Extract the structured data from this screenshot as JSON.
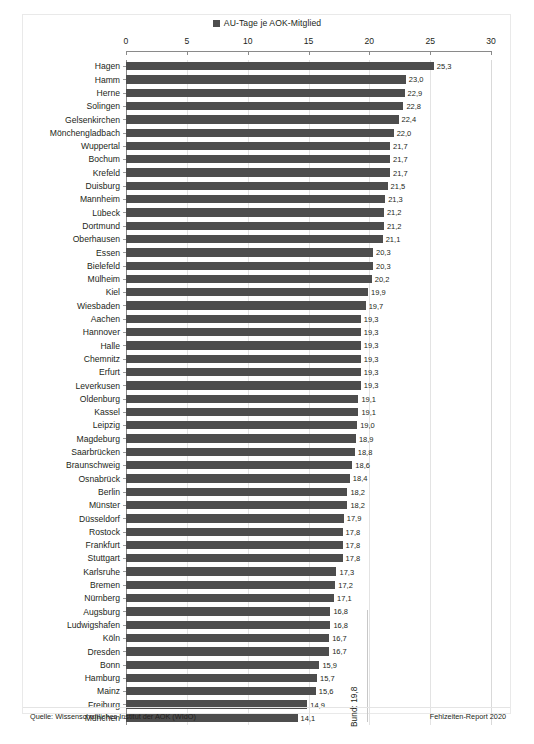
{
  "legend": {
    "swatch_color": "#4d4d4d",
    "label": "AU-Tage je AOK-Mitglied"
  },
  "footer": {
    "source": "Quelle: Wissenschaftliches Institut der AOK (WIdO)",
    "report": "Fehlzeiten-Report 2020"
  },
  "annotation": {
    "bund_label": "Bund: 19,8",
    "bund_value": 19.8
  },
  "chart_data": {
    "type": "bar",
    "orientation": "horizontal",
    "title": "",
    "subtitle": "",
    "xlabel": "",
    "ylabel": "",
    "series_name": "AU-Tage je AOK-Mitglied",
    "bar_color": "#4d4d4d",
    "grid": true,
    "legend_position": "top-center",
    "xlim": [
      0,
      30
    ],
    "xticks": [
      0,
      5,
      10,
      15,
      20,
      25,
      30
    ],
    "xtick_labels": [
      "0",
      "5",
      "10",
      "15",
      "20",
      "25",
      "30"
    ],
    "value_decimal_separator": ",",
    "reference_line": {
      "label": "Bund: 19,8",
      "value": 19.8
    },
    "categories": [
      "Hagen",
      "Hamm",
      "Herne",
      "Solingen",
      "Gelsenkirchen",
      "Mönchengladbach",
      "Wuppertal",
      "Bochum",
      "Krefeld",
      "Duisburg",
      "Mannheim",
      "Lübeck",
      "Dortmund",
      "Oberhausen",
      "Essen",
      "Bielefeld",
      "Mülheim",
      "Kiel",
      "Wiesbaden",
      "Aachen",
      "Hannover",
      "Halle",
      "Chemnitz",
      "Erfurt",
      "Leverkusen",
      "Oldenburg",
      "Kassel",
      "Leipzig",
      "Magdeburg",
      "Saarbrücken",
      "Braunschweig",
      "Osnabrück",
      "Berlin",
      "Münster",
      "Düsseldorf",
      "Rostock",
      "Frankfurt",
      "Stuttgart",
      "Karlsruhe",
      "Bremen",
      "Nürnberg",
      "Augsburg",
      "Ludwigshafen",
      "Köln",
      "Dresden",
      "Bonn",
      "Hamburg",
      "Mainz",
      "Freiburg",
      "München"
    ],
    "values": [
      25.3,
      23.0,
      22.9,
      22.8,
      22.4,
      22.0,
      21.7,
      21.7,
      21.7,
      21.5,
      21.3,
      21.2,
      21.2,
      21.1,
      20.3,
      20.3,
      20.2,
      19.9,
      19.7,
      19.3,
      19.3,
      19.3,
      19.3,
      19.3,
      19.3,
      19.1,
      19.1,
      19.0,
      18.9,
      18.8,
      18.6,
      18.4,
      18.2,
      18.2,
      17.9,
      17.8,
      17.8,
      17.8,
      17.3,
      17.2,
      17.1,
      16.8,
      16.8,
      16.7,
      16.7,
      15.9,
      15.7,
      15.6,
      14.9,
      14.1
    ],
    "value_labels": [
      "25,3",
      "23,0",
      "22,9",
      "22,8",
      "22,4",
      "22,0",
      "21,7",
      "21,7",
      "21,7",
      "21,5",
      "21,3",
      "21,2",
      "21,2",
      "21,1",
      "20,3",
      "20,3",
      "20,2",
      "19,9",
      "19,7",
      "19,3",
      "19,3",
      "19,3",
      "19,3",
      "19,3",
      "19,3",
      "19,1",
      "19,1",
      "19,0",
      "18,9",
      "18,8",
      "18,6",
      "18,4",
      "18,2",
      "18,2",
      "17,9",
      "17,8",
      "17,8",
      "17,8",
      "17,3",
      "17,2",
      "17,1",
      "16,8",
      "16,8",
      "16,7",
      "16,7",
      "15,9",
      "15,7",
      "15,6",
      "14,9",
      "14,1"
    ]
  }
}
